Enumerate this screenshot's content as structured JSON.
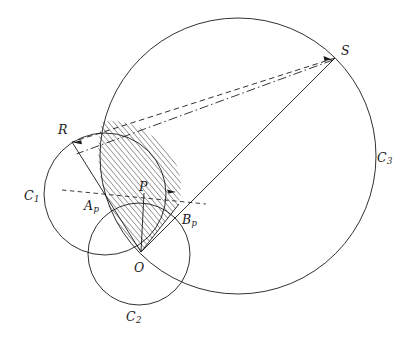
{
  "figure": {
    "type": "geometry-diagram",
    "width": 412,
    "height": 338,
    "background_color": "#ffffff",
    "stroke_color": "#1a1a1a",
    "hatch_color": "#2b2b2b"
  },
  "labels": {
    "circle1": {
      "base": "C",
      "sub": "1",
      "x": 24,
      "y": 190
    },
    "circle2": {
      "base": "C",
      "sub": "2",
      "x": 126,
      "y": 311
    },
    "circle3": {
      "base": "C",
      "sub": "3",
      "x": 377,
      "y": 152
    },
    "point_R": {
      "base": "R",
      "sub": "",
      "x": 58,
      "y": 124
    },
    "point_S": {
      "base": "S",
      "sub": "",
      "x": 341,
      "y": 45
    },
    "point_O": {
      "base": "O",
      "sub": "",
      "x": 134,
      "y": 262
    },
    "point_P": {
      "base": "P",
      "sub": "",
      "x": 139,
      "y": 181
    },
    "point_Ap": {
      "base": "A",
      "sub": "p",
      "x": 84,
      "y": 200
    },
    "point_Bp": {
      "base": "B",
      "sub": "p",
      "x": 182,
      "y": 214
    }
  },
  "circles": [
    {
      "name": "C1",
      "cx": 105,
      "cy": 194,
      "r": 61
    },
    {
      "name": "C2",
      "cx": 139,
      "cy": 254,
      "r": 51
    },
    {
      "name": "C3",
      "cx": 238,
      "cy": 156,
      "r": 138
    }
  ],
  "points": [
    {
      "name": "R",
      "x": 72,
      "y": 142
    },
    {
      "name": "S",
      "x": 335,
      "y": 58
    },
    {
      "name": "O",
      "x": 141,
      "y": 252
    },
    {
      "name": "P",
      "x": 144,
      "y": 194
    },
    {
      "name": "Ap",
      "x": 103,
      "y": 194
    },
    {
      "name": "Bp",
      "x": 171,
      "y": 201
    }
  ],
  "segments": [
    {
      "name": "S-to-R",
      "style": "dashed",
      "x1": 335,
      "y1": 58,
      "x2": 72,
      "y2": 142
    },
    {
      "name": "S-to-O",
      "style": "solid",
      "x1": 335,
      "y1": 58,
      "x2": 141,
      "y2": 252
    },
    {
      "name": "S-to-R-through-P",
      "style": "dashdot",
      "x1": 335,
      "y1": 58,
      "x2": 72,
      "y2": 142
    },
    {
      "name": "O-to-R",
      "style": "solid",
      "x1": 141,
      "y1": 252,
      "x2": 72,
      "y2": 142
    },
    {
      "name": "O-to-P",
      "style": "solid",
      "x1": 141,
      "y1": 252,
      "x2": 144,
      "y2": 194
    },
    {
      "name": "O-to-Bp-edge",
      "style": "solid",
      "x1": 141,
      "y1": 252,
      "x2": 178,
      "y2": 205
    },
    {
      "name": "Ap-axis-dashed",
      "style": "dashed",
      "x1": 64,
      "y1": 191,
      "x2": 205,
      "y2": 204
    }
  ]
}
